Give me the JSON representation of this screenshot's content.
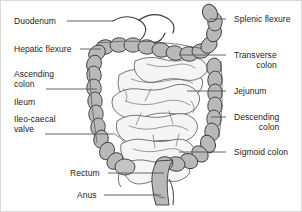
{
  "figure": {
    "style": "grayscale line drawing",
    "colors": {
      "colon_fill": "#b9b9b9",
      "colon_fill_light": "#cccccc",
      "small_intestine_fill": "#f4f4f4",
      "outline": "#3a3a3a",
      "label_text": "#232323",
      "leader_line": "#555555",
      "background": "#ffffff",
      "border": "#d9d9d9"
    },
    "labels_left": [
      {
        "id": "duodenum",
        "text": "Duodenum",
        "lines": [
          "Duodenum"
        ],
        "x": 13,
        "y": 16,
        "leader": {
          "x1": 66,
          "y1": 20,
          "x2": 112,
          "y2": 20
        }
      },
      {
        "id": "hepatic-flexure",
        "text": "Hepatic flexure",
        "lines": [
          "Hepatic flexure"
        ],
        "x": 13,
        "y": 44,
        "leader": {
          "x1": 79,
          "y1": 48,
          "x2": 100,
          "y2": 48
        }
      },
      {
        "id": "ascending-colon",
        "text": "Ascending colon",
        "lines": [
          "Ascending",
          "colon"
        ],
        "x": 13,
        "y": 69,
        "leader": {
          "x1": 45,
          "y1": 88,
          "x2": 96,
          "y2": 88
        }
      },
      {
        "id": "ileum",
        "text": "Ileum",
        "lines": [
          "Ileum"
        ],
        "x": 13,
        "y": 97,
        "leader": null
      },
      {
        "id": "ileo-caecal-valve",
        "text": "Ileo-caecal valve",
        "lines": [
          "Ileo-caecal",
          "valve"
        ],
        "x": 13,
        "y": 114,
        "leader": {
          "x1": 44,
          "y1": 133,
          "x2": 112,
          "y2": 133
        }
      },
      {
        "id": "rectum",
        "text": "Rectum",
        "lines": [
          "Rectum"
        ],
        "x": 69,
        "y": 168,
        "leader": {
          "x1": 107,
          "y1": 172,
          "x2": 163,
          "y2": 172
        }
      },
      {
        "id": "anus",
        "text": "Anus",
        "lines": [
          "Anus"
        ],
        "x": 76,
        "y": 190,
        "leader": {
          "x1": 103,
          "y1": 194,
          "x2": 160,
          "y2": 194
        }
      }
    ],
    "labels_right": [
      {
        "id": "splenic-flexure",
        "text": "Splenic flexure",
        "lines": [
          "Splenic flexure"
        ],
        "x": 233,
        "y": 14,
        "leader": {
          "x1": 225,
          "y1": 18,
          "x2": 208,
          "y2": 18
        }
      },
      {
        "id": "transverse-colon",
        "text": "Transverse colon",
        "lines": [
          "Transverse",
          "colon"
        ],
        "x": 233,
        "y": 50,
        "leader": {
          "x1": 225,
          "y1": 54,
          "x2": 178,
          "y2": 54
        }
      },
      {
        "id": "jejunum",
        "text": "Jejunum",
        "lines": [
          "Jejunum"
        ],
        "x": 233,
        "y": 86,
        "leader": {
          "x1": 225,
          "y1": 90,
          "x2": 186,
          "y2": 90
        }
      },
      {
        "id": "descending-colon",
        "text": "Descending colon",
        "lines": [
          "Descending",
          "colon"
        ],
        "x": 233,
        "y": 112,
        "leader": {
          "x1": 225,
          "y1": 116,
          "x2": 210,
          "y2": 116
        }
      },
      {
        "id": "sigmoid-colon",
        "text": "Sigmoid colon",
        "lines": [
          "Sigmoid colon"
        ],
        "x": 233,
        "y": 147,
        "leader": {
          "x1": 225,
          "y1": 151,
          "x2": 178,
          "y2": 151
        }
      }
    ]
  }
}
